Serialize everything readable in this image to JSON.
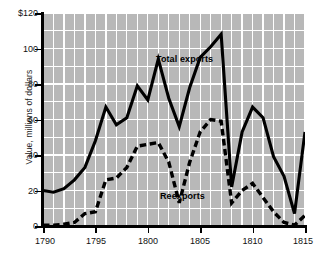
{
  "axes": {
    "ylabel": "Value, millions of dollars",
    "ytick_labels": [
      "$120",
      "100",
      "80",
      "60",
      "40",
      "20",
      "0"
    ],
    "ytick_values": [
      120,
      100,
      80,
      60,
      40,
      20,
      0
    ],
    "xtick_labels": [
      "1790",
      "1795",
      "1800",
      "1805",
      "1810",
      "1815"
    ],
    "xtick_values": [
      1790,
      1795,
      1800,
      1805,
      1810,
      1815
    ]
  },
  "annotations": {
    "total_exports": "Total exports",
    "reexports": "Reexports"
  },
  "colors": {
    "plot_background": "#b8b8b8",
    "grid": "#ffffff",
    "line": "#000000",
    "figure_background": "#ffffff",
    "text": "#111111"
  },
  "chart_data": {
    "type": "line",
    "title": "",
    "subtitle": "",
    "xlabel": "",
    "ylabel": "Value, millions of dollars",
    "xlim": [
      1790,
      1815
    ],
    "ylim": [
      0,
      120
    ],
    "grid": true,
    "legend_position": "inline-annotations",
    "x": [
      1790,
      1791,
      1792,
      1793,
      1794,
      1795,
      1796,
      1797,
      1798,
      1799,
      1800,
      1801,
      1802,
      1803,
      1804,
      1805,
      1806,
      1807,
      1808,
      1809,
      1810,
      1811,
      1812,
      1813,
      1814,
      1815
    ],
    "series": [
      {
        "name": "Total exports",
        "style": "solid",
        "values": [
          20,
          19,
          21,
          26,
          33,
          48,
          67,
          57,
          61,
          79,
          71,
          94,
          72,
          56,
          78,
          95,
          101,
          108,
          22,
          53,
          67,
          61,
          39,
          28,
          7,
          53
        ]
      },
      {
        "name": "Reexports",
        "style": "dashed",
        "values": [
          0.5,
          0.5,
          1,
          2,
          7,
          8,
          26,
          27,
          33,
          45,
          46,
          47,
          36,
          13,
          36,
          53,
          60,
          59,
          13,
          20,
          24,
          16,
          8,
          2,
          0.5,
          6
        ]
      }
    ]
  }
}
